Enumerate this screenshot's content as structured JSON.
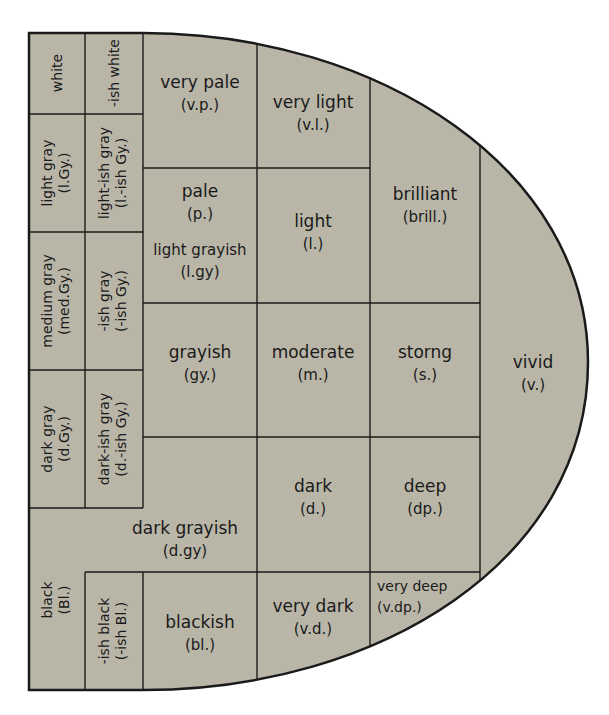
{
  "colors": {
    "fill": "#b9b6a8",
    "line": "#1a1a1a",
    "background": "#ffffff"
  },
  "cells": {
    "white": {
      "name": "white",
      "abbr": ""
    },
    "ish_white": {
      "name": "-ish white",
      "abbr": ""
    },
    "light_gray": {
      "name": "light gray",
      "abbr": "(l.Gy.)"
    },
    "light_ish_gray": {
      "name": "light-ish gray",
      "abbr": "(l.-ish Gy.)"
    },
    "medium_gray": {
      "name": "medium gray",
      "abbr": "(med.Gy.)"
    },
    "ish_gray": {
      "name": "-ish gray",
      "abbr": "(-ish Gy.)"
    },
    "dark_gray": {
      "name": "dark gray",
      "abbr": "(d.Gy.)"
    },
    "dark_ish_gray": {
      "name": "dark-ish gray",
      "abbr": "(d.-ish Gy.)"
    },
    "black": {
      "name": "black",
      "abbr": "(Bl.)"
    },
    "ish_black": {
      "name": "-ish black",
      "abbr": "(-ish Bl.)"
    },
    "very_pale": {
      "name": "very pale",
      "abbr": "(v.p.)"
    },
    "pale": {
      "name": "pale",
      "abbr": "(p.)"
    },
    "light_grayish": {
      "name": "light grayish",
      "abbr": "(l.gy)"
    },
    "grayish": {
      "name": "grayish",
      "abbr": "(gy.)"
    },
    "dark_grayish": {
      "name": "dark grayish",
      "abbr": "(d.gy)"
    },
    "blackish": {
      "name": "blackish",
      "abbr": "(bl.)"
    },
    "very_light": {
      "name": "very light",
      "abbr": "(v.l.)"
    },
    "light": {
      "name": "light",
      "abbr": "(l.)"
    },
    "moderate": {
      "name": "moderate",
      "abbr": "(m.)"
    },
    "dark": {
      "name": "dark",
      "abbr": "(d.)"
    },
    "very_dark": {
      "name": "very dark",
      "abbr": "(v.d.)"
    },
    "brilliant": {
      "name": "brilliant",
      "abbr": "(brill.)"
    },
    "strong": {
      "name": "storng",
      "abbr": "(s.)"
    },
    "deep": {
      "name": "deep",
      "abbr": "(dp.)"
    },
    "very_deep": {
      "name": "very deep",
      "abbr": "(v.dp.)"
    },
    "vivid": {
      "name": "vivid",
      "abbr": "(v.)"
    }
  }
}
